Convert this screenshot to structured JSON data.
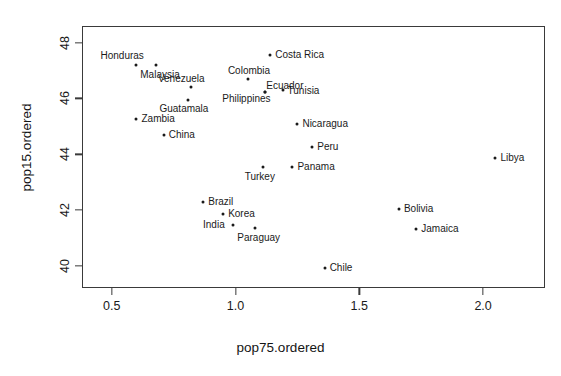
{
  "chart_data": {
    "type": "scatter",
    "title": "",
    "xlabel": "pop75.ordered",
    "ylabel": "pop15.ordered",
    "xlim": [
      0.38,
      2.25
    ],
    "ylim": [
      39.2,
      48.6
    ],
    "xticks": [
      0.5,
      1.0,
      1.5,
      2.0
    ],
    "xtick_labels": [
      "0.5",
      "1.0",
      "1.5",
      "2.0"
    ],
    "yticks": [
      40,
      42,
      44,
      46,
      48
    ],
    "ytick_labels": [
      "40",
      "42",
      "44",
      "46",
      "48"
    ],
    "grid": false,
    "legend": null,
    "marker": "point",
    "point_color": "#1a1a1a",
    "frame_color": "#3a3a3a",
    "points": [
      {
        "label": "Honduras",
        "x": 0.6,
        "y": 47.2,
        "lx": -36,
        "ly": -15
      },
      {
        "label": "Malaysia",
        "x": 0.68,
        "y": 47.2,
        "lx": -16,
        "ly": 4
      },
      {
        "label": "Costa Rica",
        "x": 1.14,
        "y": 47.55,
        "lx": 5,
        "ly": -6
      },
      {
        "label": "Colombia",
        "x": 1.05,
        "y": 46.7,
        "lx": -20,
        "ly": -14
      },
      {
        "label": "Venezuela",
        "x": 0.82,
        "y": 46.4,
        "lx": -33,
        "ly": -14
      },
      {
        "label": "Ecuador",
        "x": 1.12,
        "y": 46.25,
        "lx": 1,
        "ly": -12
      },
      {
        "label": "Tunisia",
        "x": 1.19,
        "y": 46.3,
        "lx": 5,
        "ly": -5
      },
      {
        "label": "Philippines",
        "x": 1.12,
        "y": 46.25,
        "lx": -43,
        "ly": 1
      },
      {
        "label": "Guatamala",
        "x": 0.81,
        "y": 45.95,
        "lx": -29,
        "ly": 3
      },
      {
        "label": "Zambia",
        "x": 0.6,
        "y": 45.25,
        "lx": 5,
        "ly": -6
      },
      {
        "label": "China",
        "x": 0.71,
        "y": 44.7,
        "lx": 5,
        "ly": -6
      },
      {
        "label": "Nicaragua",
        "x": 1.25,
        "y": 45.1,
        "lx": 5,
        "ly": -6
      },
      {
        "label": "Peru",
        "x": 1.31,
        "y": 44.25,
        "lx": 5,
        "ly": -6
      },
      {
        "label": "Panama",
        "x": 1.23,
        "y": 43.55,
        "lx": 5,
        "ly": -6
      },
      {
        "label": "Turkey",
        "x": 1.11,
        "y": 43.55,
        "lx": -18,
        "ly": 4
      },
      {
        "label": "Libya",
        "x": 2.05,
        "y": 43.85,
        "lx": 5,
        "ly": -6
      },
      {
        "label": "Brazil",
        "x": 0.87,
        "y": 42.3,
        "lx": 5,
        "ly": -6
      },
      {
        "label": "Bolivia",
        "x": 1.66,
        "y": 42.05,
        "lx": 5,
        "ly": -6
      },
      {
        "label": "Korea",
        "x": 0.95,
        "y": 41.85,
        "lx": 5,
        "ly": -6
      },
      {
        "label": "India",
        "x": 0.99,
        "y": 41.45,
        "lx": -30,
        "ly": -6
      },
      {
        "label": "Jamaica",
        "x": 1.73,
        "y": 41.3,
        "lx": 5,
        "ly": -6
      },
      {
        "label": "Paraguay",
        "x": 1.08,
        "y": 41.35,
        "lx": -18,
        "ly": 4
      },
      {
        "label": "Chile",
        "x": 1.36,
        "y": 39.9,
        "lx": 5,
        "ly": -6
      }
    ]
  }
}
